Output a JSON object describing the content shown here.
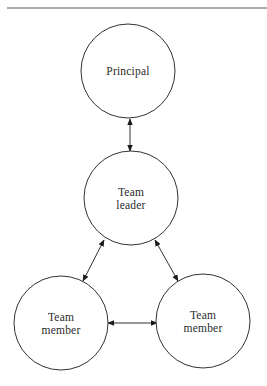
{
  "diagram": {
    "type": "relationship-diagram",
    "rule": {
      "x1": 7,
      "y1": 8,
      "x2": 267,
      "y2": 8,
      "color": "#555555"
    },
    "stroke_color": "#333333",
    "nodes": [
      {
        "id": "principal",
        "lines": [
          "Principal"
        ],
        "cx": 128,
        "cy": 71,
        "r": 47
      },
      {
        "id": "team-leader",
        "lines": [
          "Team",
          "leader"
        ],
        "cx": 131,
        "cy": 198,
        "r": 47
      },
      {
        "id": "team-member-left",
        "lines": [
          "Team",
          "member"
        ],
        "cx": 61,
        "cy": 323,
        "r": 47
      },
      {
        "id": "team-member-right",
        "lines": [
          "Team",
          "member"
        ],
        "cx": 203,
        "cy": 321,
        "r": 47
      }
    ],
    "edges": [
      {
        "from": "principal",
        "to": "team-leader",
        "direction": "bidirectional",
        "x1": 130,
        "y1": 119,
        "x2": 130,
        "y2": 151
      },
      {
        "from": "team-leader",
        "to": "team-member-left",
        "direction": "bidirectional",
        "x1": 104,
        "y1": 240,
        "x2": 83,
        "y2": 281
      },
      {
        "from": "team-leader",
        "to": "team-member-right",
        "direction": "bidirectional",
        "x1": 155,
        "y1": 240,
        "x2": 178,
        "y2": 281
      },
      {
        "from": "team-member-left",
        "to": "team-member-right",
        "direction": "bidirectional",
        "x1": 108,
        "y1": 323,
        "x2": 157,
        "y2": 323
      }
    ]
  }
}
